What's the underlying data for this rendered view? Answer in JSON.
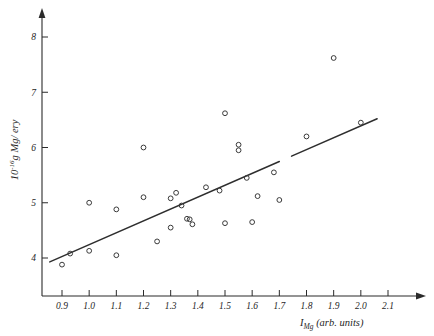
{
  "figure": {
    "background_color": "#ffffff",
    "ink_color": "#2e2e2e"
  },
  "chart_data": {
    "type": "scatter",
    "title": "",
    "subtitle": "",
    "xlabel": "I_Mg (arb. units)",
    "xlabel_parts": {
      "symbol": "I",
      "subscript": "Mg",
      "units": "(arb. units)"
    },
    "ylabel": "10^-16 g Mg / ery",
    "ylabel_parts": {
      "mantissa": "10",
      "exponent": "-16",
      "rest": "g Mg/ ery"
    },
    "xlim": [
      0.83,
      2.17
    ],
    "ylim": [
      3.55,
      8.45
    ],
    "xticks": [
      0.9,
      1.0,
      1.1,
      1.2,
      1.3,
      1.4,
      1.5,
      1.6,
      1.7,
      1.8,
      1.9,
      2.0,
      2.1
    ],
    "xtick_labels": [
      "0.9",
      "1.0",
      "1.1",
      "1.2",
      "1.3",
      "1.4",
      "1.5",
      "1.6",
      "1.7",
      "1.8",
      "1.9",
      "2.0",
      "2.1"
    ],
    "yticks": [
      4,
      5,
      6,
      7,
      8
    ],
    "ytick_labels": [
      "4",
      "5",
      "6",
      "7",
      "8"
    ],
    "grid": false,
    "legend": null,
    "marker": "open-circle",
    "points": [
      {
        "x": 0.9,
        "y": 3.88
      },
      {
        "x": 0.93,
        "y": 4.08
      },
      {
        "x": 1.0,
        "y": 5.0
      },
      {
        "x": 1.0,
        "y": 4.13
      },
      {
        "x": 1.1,
        "y": 4.88
      },
      {
        "x": 1.1,
        "y": 4.05
      },
      {
        "x": 1.2,
        "y": 6.0
      },
      {
        "x": 1.2,
        "y": 5.1
      },
      {
        "x": 1.25,
        "y": 4.3
      },
      {
        "x": 1.3,
        "y": 5.08
      },
      {
        "x": 1.3,
        "y": 4.55
      },
      {
        "x": 1.32,
        "y": 5.18
      },
      {
        "x": 1.34,
        "y": 4.95
      },
      {
        "x": 1.36,
        "y": 4.71
      },
      {
        "x": 1.37,
        "y": 4.7
      },
      {
        "x": 1.38,
        "y": 4.61
      },
      {
        "x": 1.43,
        "y": 5.28
      },
      {
        "x": 1.48,
        "y": 5.22
      },
      {
        "x": 1.5,
        "y": 4.63
      },
      {
        "x": 1.5,
        "y": 6.62
      },
      {
        "x": 1.55,
        "y": 6.05
      },
      {
        "x": 1.55,
        "y": 5.95
      },
      {
        "x": 1.58,
        "y": 5.45
      },
      {
        "x": 1.6,
        "y": 4.65
      },
      {
        "x": 1.62,
        "y": 5.12
      },
      {
        "x": 1.68,
        "y": 5.55
      },
      {
        "x": 1.7,
        "y": 5.05
      },
      {
        "x": 1.8,
        "y": 6.2
      },
      {
        "x": 1.9,
        "y": 7.62
      },
      {
        "x": 2.0,
        "y": 6.45
      }
    ],
    "fit_line": {
      "kind": "linear-regression",
      "x_start": 0.855,
      "y_start": 3.93,
      "x_end": 2.06,
      "y_end": 6.52,
      "break_x_start": 1.7,
      "break_x_end": 1.745
    }
  }
}
